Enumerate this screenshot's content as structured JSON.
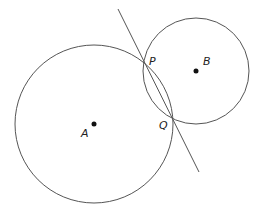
{
  "diagram": {
    "type": "geometry",
    "stroke_color": "#555555",
    "point_color": "#111111",
    "circles": [
      {
        "name": "circle-A",
        "center": "A",
        "cx": 94,
        "cy": 124,
        "r": 79
      },
      {
        "name": "circle-B",
        "center": "B",
        "cx": 196,
        "cy": 71,
        "r": 53
      }
    ],
    "line": {
      "name": "line-PQ",
      "x1": 118,
      "y1": 9,
      "x2": 199,
      "y2": 172
    },
    "points": [
      {
        "name": "A",
        "x": 94,
        "y": 124,
        "dot": true
      },
      {
        "name": "B",
        "x": 196,
        "y": 71,
        "dot": true
      },
      {
        "name": "P",
        "x": 145,
        "y": 63,
        "dot": false
      },
      {
        "name": "Q",
        "x": 172,
        "y": 118,
        "dot": false
      }
    ],
    "labels": {
      "A": {
        "text": "A",
        "x": 81,
        "y": 137
      },
      "B": {
        "text": "B",
        "x": 203,
        "y": 65
      },
      "P": {
        "text": "P",
        "x": 149,
        "y": 65
      },
      "Q": {
        "text": "Q",
        "x": 159,
        "y": 129
      }
    }
  }
}
